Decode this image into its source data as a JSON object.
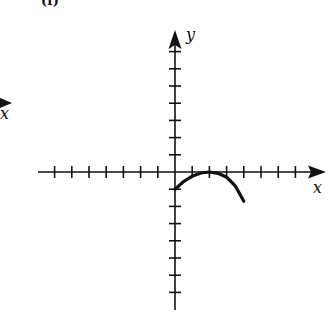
{
  "panel": {
    "label": "(f)"
  },
  "axes": {
    "x_label": "x",
    "y_label": "y",
    "x_ticks_left": 7,
    "x_ticks_right": 7,
    "y_ticks_up": 7,
    "y_ticks_down": 7,
    "tick_spacing_px": 17.2,
    "origin_px": [
      175,
      172
    ]
  },
  "neighbor_fragment": {
    "x_label": "x"
  },
  "curve": {
    "type": "downward parabola",
    "points": [
      [
        0,
        -1
      ],
      [
        1,
        -0.25
      ],
      [
        2,
        0
      ],
      [
        3,
        -0.3
      ],
      [
        4,
        -1.7
      ]
    ],
    "color": "#111111"
  },
  "chart_data": {
    "type": "line",
    "title": "(f)",
    "xlabel": "x",
    "ylabel": "y",
    "xlim": [
      -8,
      8
    ],
    "ylim": [
      -8,
      8
    ],
    "grid": false,
    "series": [
      {
        "name": "curve",
        "x": [
          0,
          0.5,
          1,
          1.5,
          2,
          2.5,
          3,
          3.5,
          4
        ],
        "y": [
          -1,
          -0.55,
          -0.25,
          -0.06,
          0,
          -0.08,
          -0.3,
          -0.8,
          -1.7
        ]
      }
    ]
  }
}
